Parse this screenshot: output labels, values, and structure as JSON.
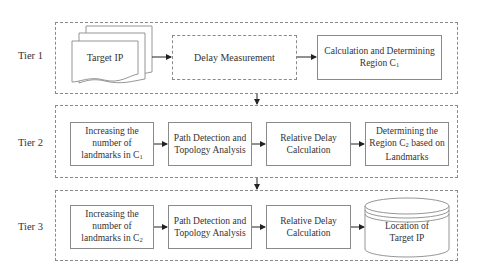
{
  "tiers": [
    {
      "label": "Tier 1",
      "nodes": [
        {
          "id": "target-ip",
          "shape": "document-stack",
          "text": "Target IP"
        },
        {
          "id": "delay-measurement",
          "shape": "dashed-rect",
          "text": "Delay Measurement"
        },
        {
          "id": "calc-region-c1",
          "shape": "rect",
          "line1": "Calculation and Determining",
          "line2": "Region C",
          "sub": "1"
        }
      ]
    },
    {
      "label": "Tier 2",
      "nodes": [
        {
          "id": "increase-landmarks-c1",
          "shape": "rect",
          "line1": "Increasing the",
          "line2": "number of",
          "line3": "landmarks in C",
          "sub": "1"
        },
        {
          "id": "path-detection-2",
          "shape": "rect",
          "line1": "Path Detection and",
          "line2": "Topology Analysis"
        },
        {
          "id": "relative-delay-2",
          "shape": "rect",
          "line1": "Relative Delay",
          "line2": "Calculation"
        },
        {
          "id": "determine-region-c2",
          "shape": "rect",
          "line1": "Determining the",
          "line2": "Region C",
          "sub": "2",
          "line2b": " based on",
          "line3": "Landmarks"
        }
      ]
    },
    {
      "label": "Tier 3",
      "nodes": [
        {
          "id": "increase-landmarks-c2",
          "shape": "rect",
          "line1": "Increasing the",
          "line2": "number of",
          "line3": "landmarks in C",
          "sub": "2"
        },
        {
          "id": "path-detection-3",
          "shape": "rect",
          "line1": "Path Detection and",
          "line2": "Topology Analysis"
        },
        {
          "id": "relative-delay-3",
          "shape": "rect",
          "line1": "Relative Delay",
          "line2": "Calculation"
        },
        {
          "id": "location-target-ip",
          "shape": "cylinder",
          "line1": "Location of",
          "line2": "Target IP"
        }
      ]
    }
  ],
  "colors": {
    "stroke": "#8a8a8a",
    "arrow": "#222222",
    "text": "#333333",
    "background": "#ffffff"
  }
}
